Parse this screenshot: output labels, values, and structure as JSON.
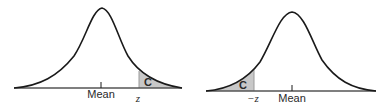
{
  "diagrams": [
    {
      "id": "right-tail",
      "center_label": "Mean",
      "critical_label": "z",
      "shaded_label": "C",
      "shaded_side": "right"
    },
    {
      "id": "left-tail",
      "center_label": "Mean",
      "critical_label": "−z",
      "shaded_label": "C",
      "shaded_side": "left"
    }
  ],
  "colors": {
    "curve": "#1a1a1a",
    "shade": "#c8c8c8",
    "baseline": "#555555"
  }
}
